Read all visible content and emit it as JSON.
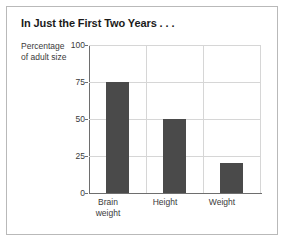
{
  "chart_data": {
    "type": "bar",
    "title": "In Just the First Two Years . . .",
    "categories": [
      "Brain weight",
      "Height",
      "Weight"
    ],
    "category_lines": [
      [
        "Brain",
        "weight"
      ],
      [
        "Height"
      ],
      [
        "Weight"
      ]
    ],
    "values": [
      75,
      50,
      20
    ],
    "xlabel": "",
    "ylabel": "Percentage of adult size",
    "ylabel_lines": [
      "Percentage",
      "of adult size"
    ],
    "ylim": [
      0,
      100
    ],
    "yticks": [
      100,
      75,
      50,
      25,
      0
    ],
    "ytick_labels": [
      "100",
      "75",
      "50",
      "25",
      "0"
    ],
    "grid": true,
    "legend": "none",
    "colors": {
      "bar_fill": "#4a4a4a",
      "gridline": "#d6d6d6",
      "axis_line": "#6e6e6e",
      "frame_border": "#b9b9b9",
      "title_text": "#1a1a1a",
      "tick_text": "#3a3a3a",
      "background": "#ffffff"
    }
  }
}
